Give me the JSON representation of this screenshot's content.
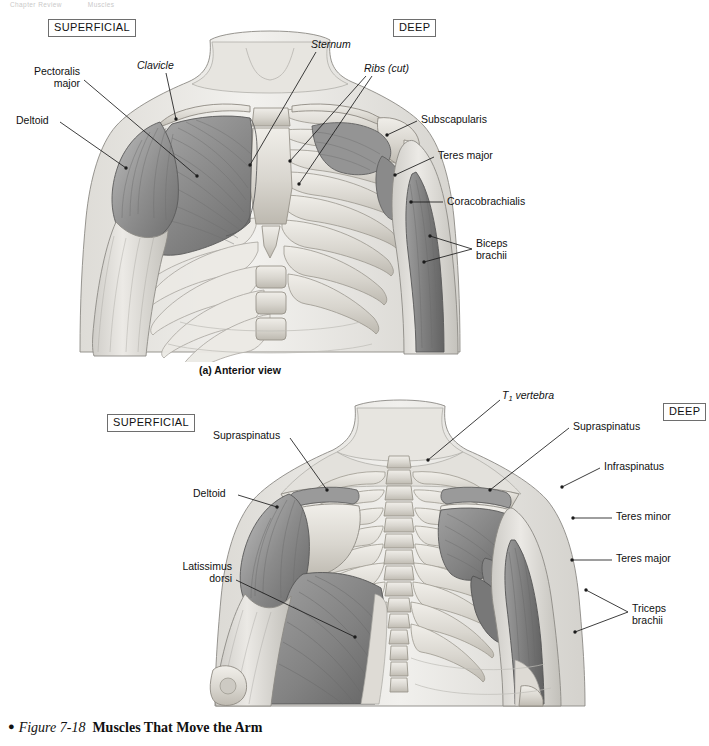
{
  "running_head": {
    "chapter": "Chapter Review",
    "section": "Muscles"
  },
  "figure": {
    "bullet": "●",
    "number": "Figure 7-18",
    "title": "Muscles That Move the Arm"
  },
  "panel_a": {
    "caption": "(a) Anterior view",
    "key_superficial": "SUPERFICIAL",
    "key_deep": "DEEP",
    "labels": [
      {
        "id": "pectoralis-major",
        "text": "Pectoralis\nmajor",
        "italic": false
      },
      {
        "id": "deltoid",
        "text": "Deltoid",
        "italic": false
      },
      {
        "id": "clavicle",
        "text": "Clavicle",
        "italic": true
      },
      {
        "id": "sternum",
        "text": "Sternum",
        "italic": true
      },
      {
        "id": "ribs-cut",
        "text": "Ribs (cut)",
        "italic": true
      },
      {
        "id": "subscapularis",
        "text": "Subscapularis",
        "italic": false
      },
      {
        "id": "teres-major",
        "text": "Teres major",
        "italic": false
      },
      {
        "id": "coracobrachialis",
        "text": "Coracobrachialis",
        "italic": false
      },
      {
        "id": "biceps-brachii",
        "text": "Biceps\nbrachii",
        "italic": false
      }
    ]
  },
  "panel_b": {
    "caption": "",
    "key_superficial": "SUPERFICIAL",
    "key_deep": "DEEP",
    "labels": [
      {
        "id": "supraspinatus-left",
        "text": "Supraspinatus",
        "italic": false
      },
      {
        "id": "deltoid",
        "text": "Deltoid",
        "italic": false
      },
      {
        "id": "latissimus-dorsi",
        "text": "Latissimus\ndorsi",
        "italic": false
      },
      {
        "id": "t1-vertebra",
        "text": "T1 vertebra",
        "italic": true
      },
      {
        "id": "supraspinatus-right",
        "text": "Supraspinatus",
        "italic": false
      },
      {
        "id": "infraspinatus",
        "text": "Infraspinatus",
        "italic": false
      },
      {
        "id": "teres-minor",
        "text": "Teres minor",
        "italic": false
      },
      {
        "id": "teres-major",
        "text": "Teres major",
        "italic": false
      },
      {
        "id": "triceps-brachii",
        "text": "Triceps\nbrachii",
        "italic": false
      }
    ]
  },
  "colors": {
    "page_background": "#ffffff",
    "leader_line": "#1b1b1b",
    "key_box_border": "#6e6e6e",
    "text": "#111111",
    "muscle_mid": "#8f8f8f",
    "muscle_dark": "#6a6a6a",
    "muscle_light": "#b4b4b4",
    "bone_light": "#e4e2dd",
    "bone_mid": "#c8c5bd",
    "skin_light": "#ededea",
    "skin_shadow": "#cfcdc8"
  }
}
